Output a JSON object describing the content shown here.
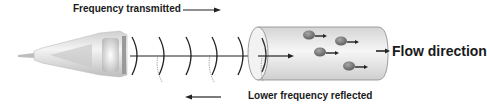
{
  "diagram": {
    "labels": {
      "transmitted": "Frequency transmitted",
      "reflected": "Lower frequency reflected",
      "flow": "Flow direction"
    },
    "components": {
      "probe": "ultrasound-transducer-probe",
      "waves": "sound-wave-arcs",
      "vessel": "blood-vessel-cylinder",
      "cells": "red-blood-cells"
    },
    "wave_count": 5,
    "cell_count": 4,
    "colors": {
      "text": "#1a1a1a",
      "line": "#222222",
      "vessel_fill": "#e6e6e6",
      "cell_fill": "#7a7a7a",
      "probe_fill": "#d8d8d8"
    }
  }
}
